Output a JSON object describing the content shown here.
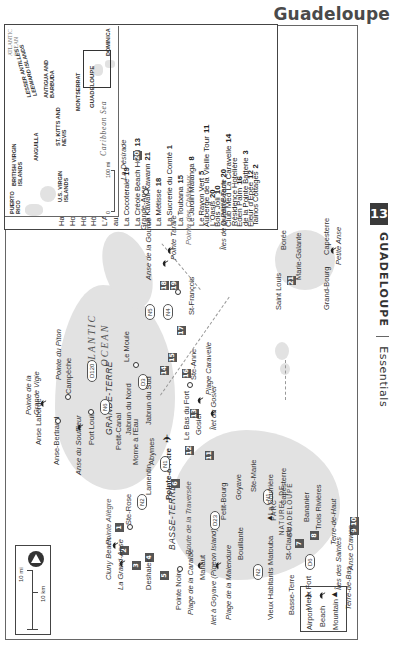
{
  "header": {
    "title": "Guadeloupe"
  },
  "side_tab": {
    "chapter_number": "13",
    "chapter_title": "GUADELOUPE",
    "section": "Essentials"
  },
  "hotel_list": {
    "column1": [
      {
        "name": "Auberge de la Vieille Tour",
        "num": "11"
      },
      {
        "name": "Bois Joli",
        "num": "10"
      },
      {
        "name": "Club Med La Caravelle",
        "num": "14"
      },
      {
        "name": "Eden Palm",
        "num": "16"
      },
      {
        "name": "Fleur d'Épée",
        "num": "12"
      }
    ],
    "column2": [
      {
        "name": "Habitation Grande Anse",
        "num": "4"
      },
      {
        "name": "Hotel Amaudo",
        "num": "17"
      },
      {
        "name": "Hôtel St-Georges",
        "num": "7"
      },
      {
        "name": "Hôtel Saint-John Perse",
        "num": "6"
      },
      {
        "name": "L'Auberge les Petits Saints",
        "num": ""
      },
      {
        "name": "   aux Anacardiers",
        "num": "9"
      },
      {
        "name": "La Cocoteraie",
        "num": "19"
      },
      {
        "name": "La Créole Beach Hôtel",
        "num": "13"
      },
      {
        "name": "La Kawali Kawann",
        "num": "21"
      },
      {
        "name": "La Métisse",
        "num": "18"
      },
      {
        "name": "La Sucrerie du Comté",
        "num": "1"
      },
      {
        "name": "La Toubana",
        "num": "15"
      },
      {
        "name": "Le Jardin Malanga",
        "num": "8"
      },
      {
        "name": "Le Rayon Vert",
        "num": "5"
      },
      {
        "name": "L'Oasis",
        "num": "20"
      },
      {
        "name": "Oualiri Beach",
        "num": "20"
      },
      {
        "name": "Résidence Hotelière",
        "num": ""
      },
      {
        "name": "   de la Pointe Batterie",
        "num": "3"
      },
      {
        "name": "Tainos Cottages",
        "num": "2"
      }
    ]
  },
  "scale": {
    "miles": "10 mi",
    "km": "10 km",
    "zero": "0"
  },
  "map_legend": [
    {
      "icon": "airport-icon",
      "label": "Airport"
    },
    {
      "icon": "beach-icon",
      "label": "Beach"
    },
    {
      "icon": "mountain-icon",
      "label": "Mountain"
    }
  ],
  "labels": {
    "ocean": "ATLANTIC OCEAN",
    "grande_terre": "GRANDE-TERRE",
    "basse_terre": "BASSE-TERRE",
    "park": "PARC NATUREL DE GUADELOUPE",
    "pointe_grande_vigie": "Pointe de la Grande Vigie",
    "pointe_piton": "Pointe du Piton",
    "campeche": "Campêche",
    "anse_laborde": "Anse Laborde",
    "anse_bertrand": "Anse-Bertrand",
    "anse_souffleur": "Anse du Souffleur",
    "port_louis": "Port Louis",
    "petit_canal": "Petit-Canal",
    "morne_eau": "Morne à l'Eau",
    "abymes": "Abymes",
    "pointe_a_pitre": "Pointe-à-Pitre",
    "le_moule": "Le Moule",
    "jabrun_nord": "Jabrun du Nord",
    "jabrun_sud": "Jabrun du Sud",
    "bas_du_fort": "Le Bas du Fort",
    "gosier": "Gosier",
    "ilet_gosier": "Îlet du Gosier",
    "plage_caravelle": "Plage Caravelle",
    "ste_anne": "Ste-Anne",
    "st_francois": "St-François",
    "anse_gourde": "Anse de la Gourde",
    "pointe_tarare": "Pointe Tarare",
    "pointe_chateaux": "Pointe des Châteaux",
    "grande_anse": "Grande-Anse",
    "desirade": "La Désirade",
    "petite_terre": "Îles de la Petite Terre",
    "pointe_allegre": "Pointe Allègre",
    "ste_rose": "Ste-Rose",
    "lamentin": "Lamentin",
    "cluny": "Cluny Beach",
    "grand_anse_beach": "La Grand-Anse",
    "deshaies": "Deshaies",
    "pointe_noire": "Pointe Noire",
    "route_traversee": "Route de la Traversée",
    "plage_caraibe": "Plage de la Caraïbe",
    "mahaut": "Mahaut",
    "ilet_goyave": "Ilet à Goyave (Pigeon Island)",
    "plage_malendure": "Plage de la Malendure",
    "bouillante": "Bouillante",
    "petit_bourg": "Petit-Bourg",
    "goyave": "Goyave",
    "ste_marie": "Ste-Marie",
    "capesterre": "Capesterre",
    "soufriere": "La Soufrière",
    "matouba": "Matouba",
    "st_claude": "St-Claude",
    "banannier": "Bananier",
    "trois_rivieres": "Trois Rivières",
    "vieux_habitants": "Vieux Habitants",
    "basse_terre_town": "Basse-Terre",
    "vieux_fort": "Vieux Fort",
    "iles_saintes": "Îles des Saintes",
    "terre_haut": "Terre-de-Haut",
    "terre_bas": "Terre-de-Bas",
    "anse_crawen": "Anse Crawen",
    "marie_galante": "Marie-Galante",
    "boree": "Borée",
    "saint_louis": "Saint Louis",
    "grand_bourg": "Grand-Bourg",
    "capesterre_mg": "Capesterre",
    "petite_anse": "Petite Anse"
  },
  "roads": [
    "N6",
    "D120",
    "D3",
    "N5",
    "N4",
    "N2",
    "N1",
    "D23",
    "N2",
    "N1",
    "D6"
  ],
  "inset": {
    "atlantic": "ATLANTIC OCEAN",
    "lesser_antilles": "LESSER ANTILLES LEEWARD ISLANDS",
    "bvi": "BRITISH VIRGIN ISLANDS",
    "anguilla": "ANGUILLA",
    "antigua": "ANTIGUA AND BARBUDA",
    "puerto_rico": "PUERTO RICO",
    "usvi": "U.S. VIRGIN ISLANDS",
    "st_kitts": "ST. KITTS AND NEVIS",
    "montserrat": "MONTSERRAT",
    "guadeloupe": "GUADELOUPE",
    "dominica": "DOMINICA",
    "caribbean": "Caribbean Sea",
    "scale_zero": "0",
    "scale_100": "100 mi"
  },
  "colors": {
    "land": "#e2e2e2",
    "marker": "#555555",
    "frame": "#666666",
    "tab": "#3a3a3a"
  }
}
